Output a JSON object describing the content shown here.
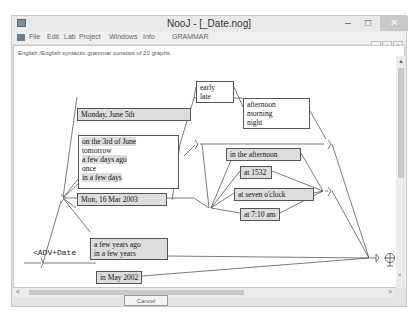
{
  "window": {
    "title": "NooJ - [_Date.nog]",
    "controls": {
      "minimize": "–",
      "maximize": "□",
      "close": "✕"
    }
  },
  "menubar": {
    "items": [
      {
        "label": "File"
      },
      {
        "label": "Edit"
      },
      {
        "label": "Lab"
      },
      {
        "label": "Project"
      },
      {
        "label": "Windows"
      },
      {
        "label": "Info"
      },
      {
        "label": "GRAMMAR"
      }
    ],
    "mdi_controls": {
      "minimize": "_",
      "restore": "▫",
      "close": "×"
    }
  },
  "status_text": "English /English syntactic grammar consists of 20 graphs.",
  "graph": {
    "nodes": {
      "monday": [
        "Monday, June 5th"
      ],
      "relative": [
        "on the 3rd of June",
        "tomorrow",
        "a few days ago",
        "once",
        "in a few days"
      ],
      "mon16": [
        "Mon, 16 Mar 2003"
      ],
      "earlylate": [
        "early",
        "late"
      ],
      "timeofday": [
        "afternoon",
        "morning",
        "night"
      ],
      "in_afternoon": [
        "in the afternoon"
      ],
      "at1532": [
        "at 1532"
      ],
      "at_seven": [
        "at seven o'clock"
      ],
      "at710": [
        "at 7:10 am"
      ],
      "years": [
        "a few years ago",
        "in a few years"
      ],
      "may2002": [
        "in May 2002"
      ]
    },
    "output_label": "<ADV+Date",
    "terminal_icon": "final-node-icon"
  },
  "scrollbars": {
    "up": "▲",
    "down": "˅",
    "left": "<",
    "right": ">"
  },
  "footer": {
    "cancel_label": "Cancel"
  }
}
